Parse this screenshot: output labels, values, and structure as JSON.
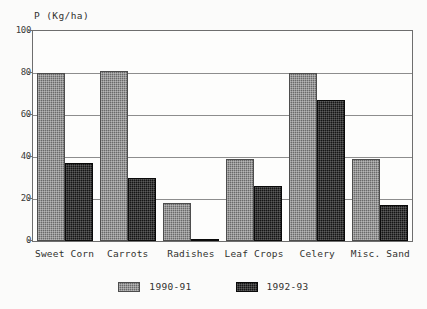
{
  "chart_data": {
    "type": "bar",
    "title": "",
    "subtitle": "",
    "xlabel": "",
    "ylabel": "P (Kg/ha)",
    "ylim": [
      0,
      100
    ],
    "yticks": [
      0,
      20,
      40,
      60,
      80,
      100
    ],
    "ytick_labels": [
      "0",
      "20",
      "40",
      "60",
      "80",
      "100"
    ],
    "grid": true,
    "grid_axis": "y",
    "legend_position": "bottom",
    "categories": [
      "Sweet Corn",
      "Carrots",
      "Radishes",
      "Leaf Crops",
      "Celery",
      "Misc. Sand"
    ],
    "series": [
      {
        "name": "1990-91",
        "color": "#6a6a6a",
        "values": [
          80,
          81,
          18,
          39,
          80,
          39
        ]
      },
      {
        "name": "1992-93",
        "color": "#151515",
        "values": [
          37,
          30,
          1,
          26,
          67,
          17
        ]
      }
    ]
  },
  "axis": {
    "y_title": "P (Kg/ha)"
  },
  "legend": {
    "entries": [
      {
        "label": "1990-91",
        "swatch": "gray-hatch-swatch"
      },
      {
        "label": "1992-93",
        "swatch": "black-hatch-swatch"
      }
    ]
  }
}
